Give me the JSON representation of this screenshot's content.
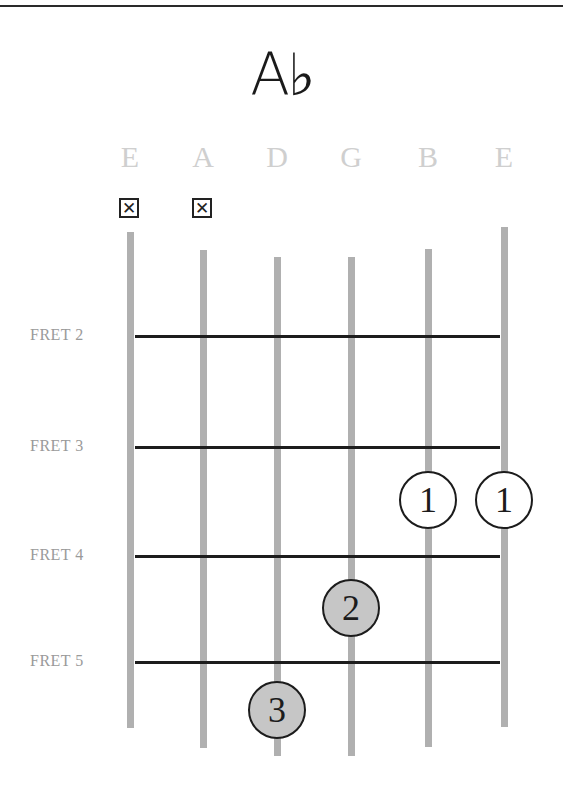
{
  "chord": {
    "name": "A♭"
  },
  "strings": [
    {
      "name": "E",
      "x": 130,
      "top": 232,
      "bottom": 728,
      "muted": true
    },
    {
      "name": "A",
      "x": 203,
      "top": 250,
      "bottom": 748,
      "muted": true
    },
    {
      "name": "D",
      "x": 277,
      "top": 257,
      "bottom": 756,
      "muted": false
    },
    {
      "name": "G",
      "x": 351,
      "top": 257,
      "bottom": 756,
      "muted": false
    },
    {
      "name": "B",
      "x": 428,
      "top": 249,
      "bottom": 747,
      "muted": false
    },
    {
      "name": "E",
      "x": 504,
      "top": 227,
      "bottom": 727,
      "muted": false
    }
  ],
  "mute_symbol": "✕",
  "frets": [
    {
      "label": "FRET 2",
      "y": 336
    },
    {
      "label": "FRET 3",
      "y": 447
    },
    {
      "label": "FRET 4",
      "y": 556
    },
    {
      "label": "FRET 5",
      "y": 662
    }
  ],
  "fingers": [
    {
      "string": "B",
      "fret": 3,
      "finger": "1",
      "x": 428,
      "y": 500,
      "style": "open"
    },
    {
      "string": "E",
      "fret": 3,
      "finger": "1",
      "x": 504,
      "y": 500,
      "style": "open"
    },
    {
      "string": "G",
      "fret": 4,
      "finger": "2",
      "x": 351,
      "y": 608,
      "style": "filled"
    },
    {
      "string": "D",
      "fret": 5,
      "finger": "3",
      "x": 277,
      "y": 710,
      "style": "filled"
    }
  ],
  "colors": {
    "string": "#b0b0b0",
    "fret": "#1c1c1c",
    "filled_dot": "#c6c6c6",
    "string_label": "#cfcfcf",
    "fret_label": "#9a9a9a"
  }
}
